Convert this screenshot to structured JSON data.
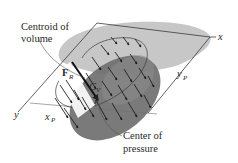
{
  "figure": {
    "labels": {
      "centroid_line1": "Centroid of",
      "centroid_line2": "volume",
      "center_line1": "Center of",
      "center_line2": "pressure",
      "force_main": "F",
      "force_sub": "R",
      "centroid_main": "C",
      "centroid_sub": "V",
      "point_p": "P",
      "axis_x": "x",
      "axis_y": "y",
      "xp_main": "x",
      "xp_sub": "P",
      "yp_main": "y",
      "yp_sub": "P"
    },
    "colors": {
      "plane_shade": "#b9b9b9",
      "plate_dark": "#6f6f6f",
      "plate_mid": "#8a8a8a",
      "line": "#3a3a3a",
      "arrow": "#1e1e1e",
      "background": "#ffffff"
    }
  }
}
